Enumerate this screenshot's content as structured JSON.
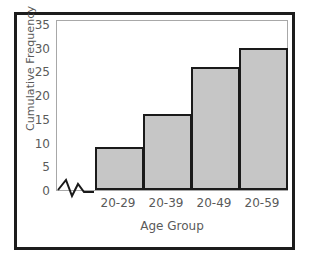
{
  "chart_data": {
    "type": "bar",
    "title": "",
    "subtitle": "",
    "xlabel": "Age Group",
    "ylabel": "Cumulative Frequency",
    "categories": [
      "20-29",
      "20-39",
      "20-49",
      "20-59"
    ],
    "values": [
      9,
      16,
      26,
      30
    ],
    "series": [
      {
        "name": "Cumulative Frequency",
        "values": [
          9,
          16,
          26,
          30
        ]
      }
    ],
    "ylim": [
      0,
      36
    ],
    "yticks": [
      0,
      5,
      10,
      15,
      20,
      25,
      30,
      35
    ],
    "ytick_labels": [
      "0",
      "5",
      "10",
      "15",
      "20",
      "25",
      "30",
      "35"
    ],
    "grid": false,
    "legend": false,
    "legend_position": "none",
    "bars_adjacent": true,
    "annotations": [
      "axis-break-zigzag-on-x-axis-before-first-bar"
    ],
    "colors": {
      "bar_fill": "#c6c6c6",
      "bar_edge": "#1a1a1a",
      "plot_border": "#a8a8a8",
      "outer_frame": "#1c1c1c",
      "text": "#5a5a5a",
      "background": "#ffffff"
    }
  }
}
